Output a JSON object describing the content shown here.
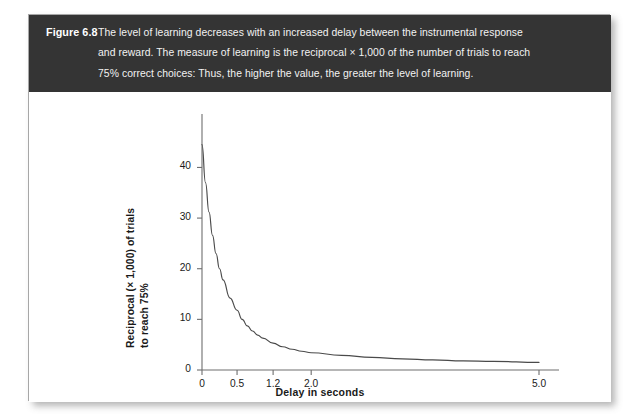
{
  "figure": {
    "label": "Figure 6.8",
    "caption_lines": [
      "The level of learning decreases with an increased delay between the instrumental response",
      "and reward. The measure of learning is the reciprocal × 1,000 of the number of trials to reach",
      "75% correct choices: Thus, the higher the value, the greater the level of learning."
    ],
    "banner_color": "#343434",
    "card_color": "#ffffff"
  },
  "chart_data": {
    "type": "line",
    "title": "",
    "subtitle": "",
    "xlabel": "Delay in seconds",
    "ylabel_line1": "Reciprocal (× 1,000) of trials",
    "ylabel_line2": "to reach 75%",
    "xtick_labels": [
      "0",
      "0.5",
      "1.2",
      "2.0",
      "5.0"
    ],
    "xtick_values": [
      0,
      0.5,
      1.2,
      2.0,
      5.0
    ],
    "xtick_positions_frac": [
      0.0,
      0.104,
      0.211,
      0.324,
      1.0
    ],
    "ytick_labels": [
      "0",
      "10",
      "20",
      "30",
      "40"
    ],
    "ytick_values": [
      0,
      10,
      20,
      30,
      40
    ],
    "ylim": [
      0,
      47
    ],
    "xlim": [
      0,
      5.0
    ],
    "grid": false,
    "legend": false,
    "line_color": "#4a4a4a",
    "axis_color": "#6e6e6e",
    "x": [
      0.0,
      0.05,
      0.1,
      0.15,
      0.2,
      0.25,
      0.3,
      0.4,
      0.5,
      0.6,
      0.7,
      0.8,
      0.9,
      1.0,
      1.2,
      1.4,
      1.6,
      1.8,
      2.0,
      2.4,
      2.8,
      3.2,
      3.6,
      4.0,
      4.4,
      5.0
    ],
    "y": [
      44.5,
      37.0,
      31.2,
      26.6,
      23.0,
      20.0,
      17.8,
      14.2,
      11.8,
      10.0,
      8.7,
      7.7,
      6.9,
      6.3,
      5.3,
      4.6,
      4.1,
      3.7,
      3.4,
      2.9,
      2.5,
      2.2,
      2.0,
      1.8,
      1.7,
      1.5
    ],
    "series": [
      {
        "name": "Level of learning vs delay",
        "x": [
          0.0,
          0.05,
          0.1,
          0.15,
          0.2,
          0.25,
          0.3,
          0.4,
          0.5,
          0.6,
          0.7,
          0.8,
          0.9,
          1.0,
          1.2,
          1.4,
          1.6,
          1.8,
          2.0,
          2.4,
          2.8,
          3.2,
          3.6,
          4.0,
          4.4,
          5.0
        ],
        "y": [
          44.5,
          37.0,
          31.2,
          26.6,
          23.0,
          20.0,
          17.8,
          14.2,
          11.8,
          10.0,
          8.7,
          7.7,
          6.9,
          6.3,
          5.3,
          4.6,
          4.1,
          3.7,
          3.4,
          2.9,
          2.5,
          2.2,
          2.0,
          1.8,
          1.7,
          1.5
        ]
      }
    ]
  }
}
